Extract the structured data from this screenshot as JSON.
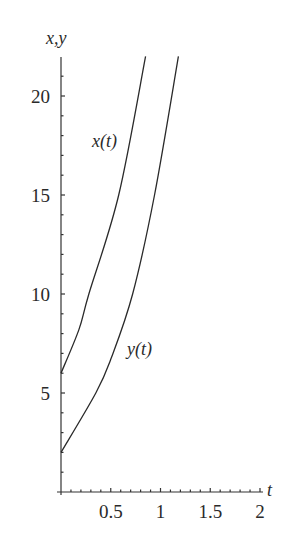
{
  "chart_data": {
    "type": "line",
    "title": "",
    "xlabel": "t",
    "ylabel": "x,y",
    "xlim": [
      0,
      2
    ],
    "ylim": [
      0,
      22
    ],
    "grid": false,
    "legend": "inline labels",
    "x_ticks": [
      0.5,
      1,
      1.5,
      2
    ],
    "x_tick_labels": [
      "0.5",
      "1",
      "1.5",
      "2"
    ],
    "y_ticks": [
      5,
      10,
      15,
      20
    ],
    "y_tick_labels": [
      "5",
      "10",
      "15",
      "20"
    ],
    "series": [
      {
        "name": "x(t)",
        "label": "x(t)",
        "points": [
          [
            0,
            6
          ],
          [
            0.18,
            8.2
          ],
          [
            0.28,
            10
          ],
          [
            0.58,
            15
          ],
          [
            0.85,
            22
          ]
        ]
      },
      {
        "name": "y(t)",
        "label": "y(t)",
        "points": [
          [
            0,
            2
          ],
          [
            0.35,
            5
          ],
          [
            0.5,
            6.7
          ],
          [
            0.72,
            10
          ],
          [
            0.94,
            15
          ],
          [
            1.18,
            22
          ]
        ]
      }
    ],
    "colors": {
      "axis": "#333333",
      "curves": "#333333",
      "background": "#ffffff"
    }
  }
}
